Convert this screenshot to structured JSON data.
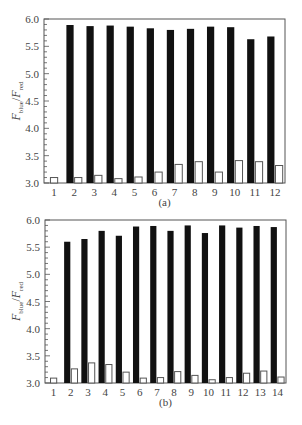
{
  "colors": {
    "filled_bar": "#111111",
    "open_bar_fill": "#ffffff",
    "open_bar_stroke": "#555555",
    "axis": "#555555",
    "text": "#444444"
  },
  "chart_data": [
    {
      "type": "bar",
      "panel_label": "(a)",
      "title": "",
      "xlabel": "",
      "ylabel": "F_blue / F_red",
      "ylabel_parts": {
        "main1": "F",
        "sub1": "blue",
        "sep": "/",
        "main2": "F",
        "sub2": "red"
      },
      "ylim": [
        3.0,
        6.0
      ],
      "yticks": [
        "3.0",
        "3.5",
        "4.0",
        "4.5",
        "5.0",
        "5.5",
        "6.0"
      ],
      "grid": false,
      "legend": null,
      "categories": [
        "1",
        "2",
        "3",
        "4",
        "5",
        "6",
        "7",
        "8",
        "9",
        "10",
        "11",
        "12"
      ],
      "series": [
        {
          "name": "filled",
          "style": "black",
          "values": [
            null,
            5.89,
            5.87,
            5.88,
            5.86,
            5.83,
            5.8,
            5.82,
            5.86,
            5.85,
            5.63,
            5.68
          ]
        },
        {
          "name": "open",
          "style": "white",
          "values": [
            3.1,
            3.1,
            3.14,
            3.08,
            3.11,
            3.2,
            3.34,
            3.39,
            3.2,
            3.41,
            3.39,
            3.32
          ]
        }
      ]
    },
    {
      "type": "bar",
      "panel_label": "(b)",
      "title": "",
      "xlabel": "",
      "ylabel": "F_blue / F_red",
      "ylabel_parts": {
        "main1": "F",
        "sub1": "blue",
        "sep": "/",
        "main2": "F",
        "sub2": "red"
      },
      "ylim": [
        3.0,
        6.0
      ],
      "yticks": [
        "3.0",
        "3.5",
        "4.0",
        "4.5",
        "5.0",
        "5.5",
        "6.0"
      ],
      "grid": false,
      "legend": null,
      "categories": [
        "1",
        "2",
        "3",
        "4",
        "5",
        "6",
        "7",
        "8",
        "9",
        "10",
        "11",
        "12",
        "13",
        "14"
      ],
      "series": [
        {
          "name": "filled",
          "style": "black",
          "values": [
            null,
            5.6,
            5.65,
            5.8,
            5.71,
            5.88,
            5.89,
            5.8,
            5.9,
            5.76,
            5.9,
            5.86,
            5.89,
            5.87
          ]
        },
        {
          "name": "open",
          "style": "white",
          "values": [
            3.09,
            3.26,
            3.37,
            3.34,
            3.2,
            3.09,
            3.1,
            3.21,
            3.14,
            3.06,
            3.1,
            3.18,
            3.22,
            3.11
          ]
        }
      ]
    }
  ]
}
